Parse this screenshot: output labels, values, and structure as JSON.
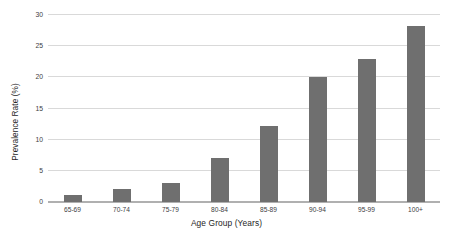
{
  "chart_data": {
    "type": "bar",
    "title": "",
    "xlabel": "Age Group (Years)",
    "ylabel": "Prevalence Rate (%)",
    "categories": [
      "65-69",
      "70-74",
      "75-79",
      "80-84",
      "85-89",
      "90-94",
      "95-99",
      "100+"
    ],
    "values": [
      1.2,
      2.1,
      3.1,
      7.1,
      12.2,
      20.1,
      23.0,
      28.3
    ],
    "ylim": [
      0,
      30
    ],
    "yticks": [
      0,
      5,
      10,
      15,
      20,
      25,
      30
    ],
    "ytick_labels": [
      "0",
      "5",
      "10",
      "15",
      "20",
      "25",
      "30"
    ],
    "grid": true,
    "legend": "none",
    "bar_color": "#6f6f6f",
    "grid_color": "#d9d9d9",
    "axis_color": "#b0b0b0",
    "background_color": "#ffffff"
  }
}
